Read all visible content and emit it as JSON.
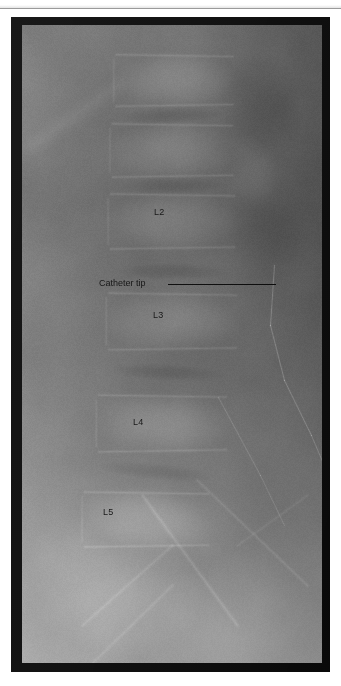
{
  "figure": {
    "modality": "radiograph",
    "view": "lateral lumbar spine",
    "frame_color": "#0d0d0d",
    "background_color": "#ffffff"
  },
  "annotations": {
    "vertebra_labels": [
      {
        "name": "L2",
        "text": "L2",
        "x": 143,
        "y": 190
      },
      {
        "name": "L3",
        "text": "L3",
        "x": 142,
        "y": 293
      },
      {
        "name": "L4",
        "text": "L4",
        "x": 122,
        "y": 400
      },
      {
        "name": "L5",
        "text": "L5",
        "x": 92,
        "y": 490
      }
    ],
    "callout": {
      "label": "Catheter tip",
      "text_x": 88,
      "text_y": 261,
      "line_x1": 157,
      "line_x2": 265,
      "line_y": 267,
      "line_color": "#0b0b0b"
    }
  },
  "image_features": {
    "catheter_color": "#d8d8d8",
    "bright_bone": "#b9b9b9",
    "soft_tissue": "#8d8d8d",
    "dark_field": "#6b6b6b"
  }
}
